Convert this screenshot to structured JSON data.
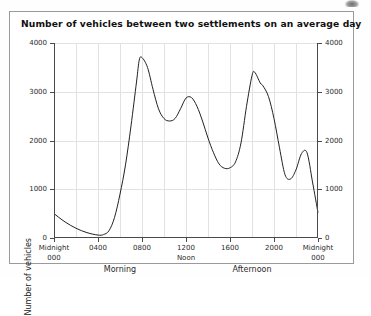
{
  "figure": {
    "title": "Number of vehicles between two settlements on an average day"
  },
  "axes": {
    "y_title": "Number of vehicles",
    "y_ticks": [
      "0",
      "1000",
      "2000",
      "3000",
      "4000"
    ],
    "y_ticks_right": [
      "0",
      "1000",
      "2000",
      "3000",
      "4000"
    ],
    "x_ticks": [
      {
        "main": "Midnight",
        "sub": "000"
      },
      {
        "main": "0400",
        "sub": ""
      },
      {
        "main": "0800",
        "sub": ""
      },
      {
        "main": "1200",
        "sub": "Noon"
      },
      {
        "main": "1600",
        "sub": ""
      },
      {
        "main": "2000",
        "sub": ""
      },
      {
        "main": "Midnight",
        "sub": "000"
      }
    ],
    "bands": [
      {
        "label": "Morning"
      },
      {
        "label": "Afternoon"
      }
    ]
  },
  "chart_data": {
    "type": "line",
    "title": "Number of vehicles between two settlements on an average day",
    "xlabel": "",
    "ylabel": "Number of vehicles",
    "xlim": [
      0,
      24
    ],
    "ylim": [
      0,
      4000
    ],
    "grid": true,
    "legend": "none",
    "x_tick_values": [
      0,
      4,
      8,
      12,
      16,
      20,
      24
    ],
    "x_tick_labels": [
      "Midnight 000",
      "0400",
      "0800",
      "1200 Noon",
      "1600",
      "2000",
      "Midnight 000"
    ],
    "y_tick_values": [
      0,
      1000,
      2000,
      3000,
      4000
    ],
    "series": [
      {
        "name": "Vehicles per hour",
        "x": [
          0,
          1,
          2,
          3,
          4,
          4.5,
          5,
          5.5,
          6,
          6.5,
          7,
          7.5,
          7.75,
          8,
          8.5,
          9,
          9.5,
          10,
          10.5,
          11,
          11.5,
          12,
          12.5,
          13,
          13.5,
          14,
          14.5,
          15,
          15.5,
          16,
          16.5,
          17,
          17.5,
          18,
          18.25,
          18.75,
          19,
          19.5,
          20,
          20.5,
          21,
          21.5,
          22,
          22.5,
          23,
          23.5,
          24
        ],
        "y": [
          500,
          330,
          200,
          110,
          60,
          70,
          150,
          420,
          900,
          1500,
          2300,
          3200,
          3650,
          3700,
          3500,
          3050,
          2650,
          2450,
          2400,
          2450,
          2650,
          2870,
          2880,
          2700,
          2400,
          2050,
          1750,
          1520,
          1430,
          1440,
          1560,
          1950,
          2700,
          3330,
          3400,
          3180,
          3120,
          2900,
          2450,
          1850,
          1300,
          1210,
          1400,
          1730,
          1750,
          1150,
          520
        ]
      }
    ],
    "annotations": [
      {
        "text": "Morning",
        "position": "below-axis-left"
      },
      {
        "text": "Afternoon",
        "position": "below-axis-right"
      }
    ]
  }
}
